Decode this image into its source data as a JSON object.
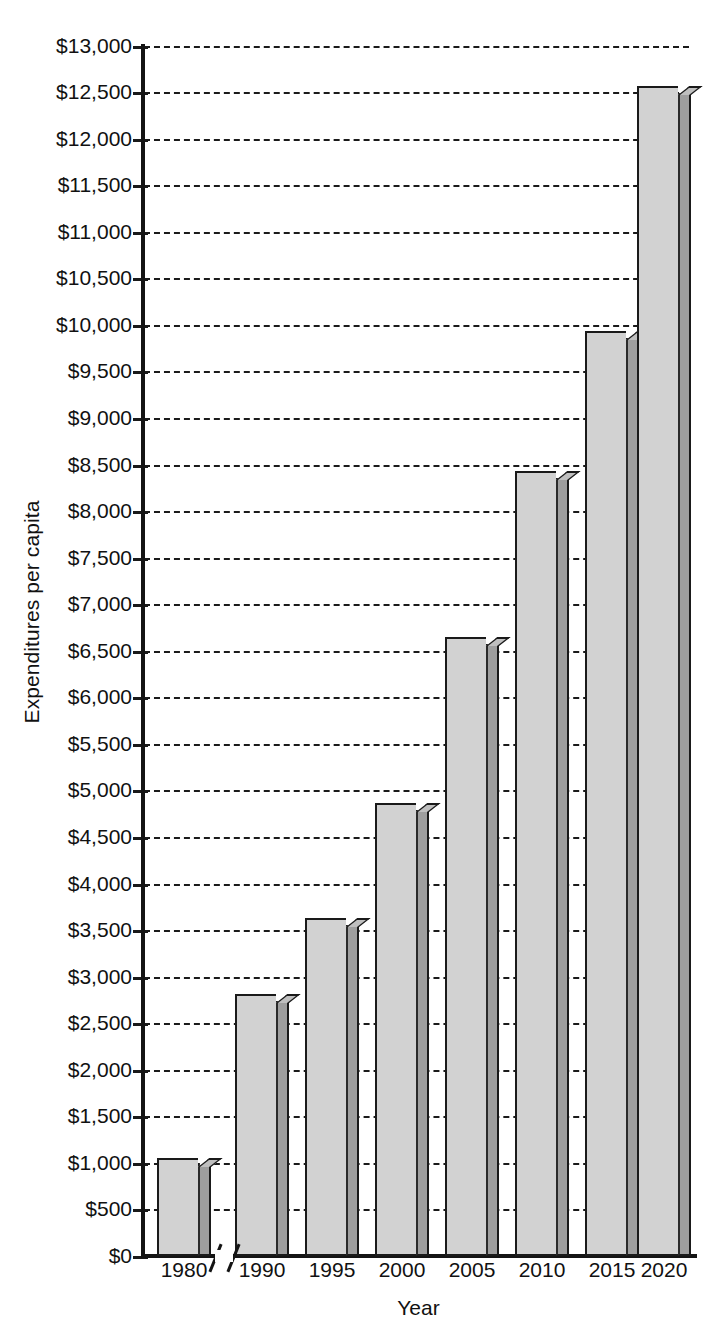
{
  "chart_data": {
    "type": "bar",
    "title": "",
    "xlabel": "Year",
    "ylabel": "Expenditures per capita",
    "categories": [
      "1980",
      "1990",
      "1995",
      "2000",
      "2005",
      "2010",
      "2015",
      "2020"
    ],
    "values": [
      1050,
      2810,
      3630,
      4870,
      6650,
      8430,
      9930,
      12560
    ],
    "ylim": [
      0,
      13000
    ],
    "ytick_step": 500,
    "ytick_labels": [
      "$13,000",
      "$12,500",
      "$12,000",
      "$11,500",
      "$11,000",
      "$10,500",
      "$10,000",
      "$9,500",
      "$9,000",
      "$8,500",
      "$8,000",
      "$7,500",
      "$7,000",
      "$6,500",
      "$6,000",
      "$5,500",
      "$5,000",
      "$4,500",
      "$4,000",
      "$3,500",
      "$3,000",
      "$2,500",
      "$2,000",
      "$1,500",
      "$1,000",
      "$500",
      "$0"
    ],
    "ytick_values": [
      13000,
      12500,
      12000,
      11500,
      11000,
      10500,
      10000,
      9500,
      9000,
      8500,
      8000,
      7500,
      7000,
      6500,
      6000,
      5500,
      5000,
      4500,
      4000,
      3500,
      3000,
      2500,
      2000,
      1500,
      1000,
      500,
      0
    ],
    "grid": true,
    "grid_style": "dashed-horizontal",
    "legend": "none",
    "axis_break": {
      "present": true,
      "between": [
        "1980",
        "1990"
      ],
      "symbol": "//"
    },
    "bar_style": {
      "three_d": true,
      "face_color": "#d2d2d2",
      "side_color": "#9e9e9e",
      "top_color": "#bfbfbf",
      "outline_color": "#1a1a1a"
    },
    "background_color": "#ffffff",
    "text_color": "#111111"
  }
}
